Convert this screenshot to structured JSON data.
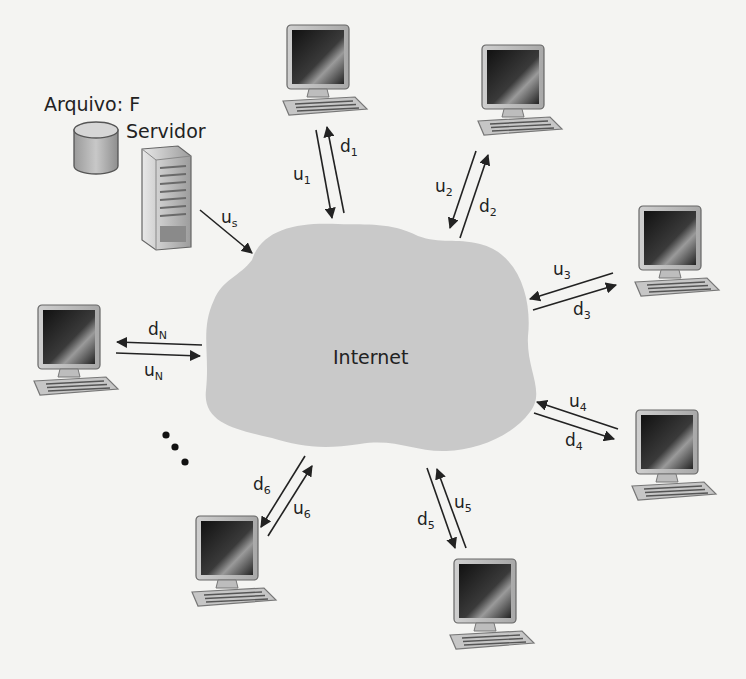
{
  "diagram": {
    "cloud_label": "Internet",
    "file_label": "Arquivo: F",
    "server_label": "Servidor",
    "server_link": {
      "label": "u",
      "sub": "s"
    },
    "peers": [
      {
        "id": 1,
        "up": {
          "label": "u",
          "sub": "1"
        },
        "down": {
          "label": "d",
          "sub": "1"
        }
      },
      {
        "id": 2,
        "up": {
          "label": "u",
          "sub": "2"
        },
        "down": {
          "label": "d",
          "sub": "2"
        }
      },
      {
        "id": 3,
        "up": {
          "label": "u",
          "sub": "3"
        },
        "down": {
          "label": "d",
          "sub": "3"
        }
      },
      {
        "id": 4,
        "up": {
          "label": "u",
          "sub": "4"
        },
        "down": {
          "label": "d",
          "sub": "4"
        }
      },
      {
        "id": 5,
        "up": {
          "label": "u",
          "sub": "5"
        },
        "down": {
          "label": "d",
          "sub": "5"
        }
      },
      {
        "id": 6,
        "up": {
          "label": "u",
          "sub": "6"
        },
        "down": {
          "label": "d",
          "sub": "6"
        }
      },
      {
        "id": "N",
        "up": {
          "label": "u",
          "sub": "N"
        },
        "down": {
          "label": "d",
          "sub": "N"
        }
      }
    ],
    "ellipsis": "..."
  },
  "colors": {
    "background": "#f4f4f2",
    "cloud": "#c9c9c9",
    "arrow": "#222222",
    "text": "#222222"
  }
}
